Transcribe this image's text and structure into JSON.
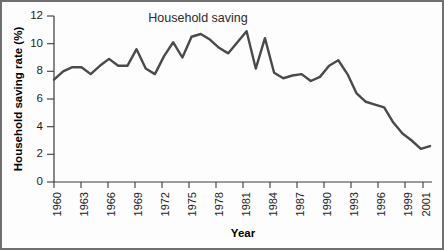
{
  "chart_data": {
    "type": "line",
    "title": "Household saving",
    "xlabel": "Year",
    "ylabel": "Household saving rate (%)",
    "xlim": [
      1960,
      2001
    ],
    "ylim": [
      0,
      12
    ],
    "yticks": [
      0,
      2,
      4,
      6,
      8,
      10,
      12
    ],
    "xticks": [
      1960,
      1963,
      1966,
      1969,
      1972,
      1975,
      1978,
      1981,
      1984,
      1987,
      1990,
      1993,
      1996,
      1999,
      2001
    ],
    "grid": false,
    "legend": "none",
    "line_color": "#4a4a4a",
    "x": [
      1960,
      1961,
      1962,
      1963,
      1964,
      1965,
      1966,
      1967,
      1968,
      1969,
      1970,
      1971,
      1972,
      1973,
      1974,
      1975,
      1976,
      1977,
      1978,
      1979,
      1980,
      1981,
      1982,
      1983,
      1984,
      1985,
      1986,
      1987,
      1988,
      1989,
      1990,
      1991,
      1992,
      1993,
      1994,
      1995,
      1996,
      1997,
      1998,
      1999,
      2000,
      2001
    ],
    "values": [
      7.4,
      8.0,
      8.3,
      8.3,
      7.8,
      8.4,
      8.9,
      8.4,
      8.4,
      9.6,
      8.2,
      7.8,
      9.1,
      10.1,
      9.0,
      10.5,
      10.7,
      10.3,
      9.7,
      9.3,
      10.1,
      10.9,
      8.2,
      10.4,
      7.9,
      7.5,
      7.7,
      7.8,
      7.3,
      7.6,
      8.4,
      8.8,
      7.8,
      6.4,
      5.8,
      5.6,
      5.4,
      4.3,
      3.5,
      3.0,
      2.4,
      2.6
    ]
  },
  "figure": {
    "border_color": "#6f6f6f"
  }
}
